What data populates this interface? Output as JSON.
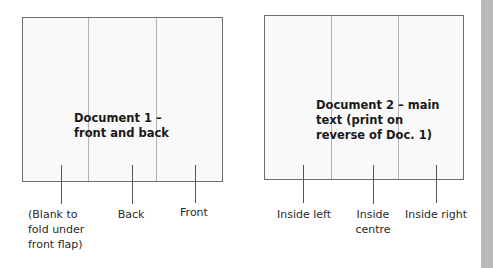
{
  "documents": [
    {
      "title_lines": [
        "Document 1 –",
        "front and back"
      ],
      "panels": [
        {
          "label_lines": [
            "(Blank to",
            "fold under",
            "front flap)"
          ]
        },
        {
          "label_lines": [
            "Back"
          ]
        },
        {
          "label_lines": [
            "Front"
          ]
        }
      ]
    },
    {
      "title_lines": [
        "Document 2 – main",
        "text (print on",
        "reverse of Doc. 1)"
      ],
      "panels": [
        {
          "label_lines": [
            "Inside left"
          ]
        },
        {
          "label_lines": [
            "Inside",
            "centre"
          ]
        },
        {
          "label_lines": [
            "Inside right"
          ]
        }
      ]
    }
  ],
  "colors": {
    "box_border": "#6e6e6e",
    "box_fill": "#f9f9f9",
    "fold_line": "#b3b3b3",
    "side_strip": "#b9b9b9"
  }
}
